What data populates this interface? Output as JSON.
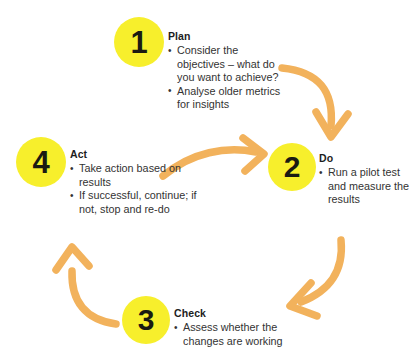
{
  "diagram": {
    "colors": {
      "badge_fill": "#f7ef2c",
      "badge_text": "#1a1a12",
      "arrow": "#f2b25c",
      "body_text": "#333333",
      "heading_text": "#1d1d1d",
      "background": "#ffffff"
    },
    "steps": [
      {
        "number": "1",
        "heading": "Plan",
        "bullets": [
          "Consider the objectives – what do you want to achieve?",
          "Analyse older metrics for insights"
        ]
      },
      {
        "number": "2",
        "heading": "Do",
        "bullets": [
          "Run a pilot test and measure the results"
        ]
      },
      {
        "number": "3",
        "heading": "Check",
        "bullets": [
          "Assess whether the changes are working"
        ]
      },
      {
        "number": "4",
        "heading": "Act",
        "bullets": [
          "Take action based on results",
          "If successful, continue; if not, stop and re-do"
        ]
      }
    ],
    "arrows": [
      {
        "name": "arrow-plan-to-do",
        "from": "1",
        "to": "2"
      },
      {
        "name": "arrow-do-to-check",
        "from": "2",
        "to": "3"
      },
      {
        "name": "arrow-check-to-act",
        "from": "3",
        "to": "4"
      },
      {
        "name": "arrow-act-to-do",
        "from": "4",
        "to": "2"
      }
    ]
  }
}
